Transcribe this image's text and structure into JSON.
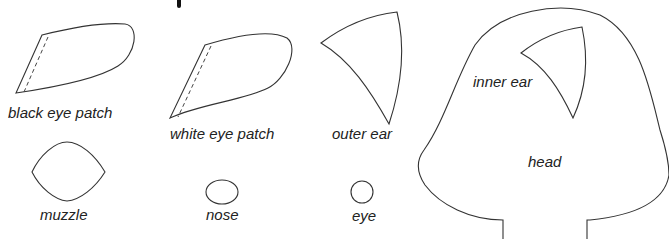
{
  "pieces": {
    "black_eye_patch": {
      "label": "black eye patch",
      "has_fold_line": true
    },
    "white_eye_patch": {
      "label": "white eye patch",
      "has_fold_line": true
    },
    "outer_ear": {
      "label": "outer ear"
    },
    "inner_ear": {
      "label": "inner ear"
    },
    "head": {
      "label": "head"
    },
    "muzzle": {
      "label": "muzzle"
    },
    "nose": {
      "label": "nose"
    },
    "eye": {
      "label": "eye"
    }
  },
  "colors": {
    "line": "#333333",
    "background": "#ffffff",
    "text": "#222222"
  }
}
